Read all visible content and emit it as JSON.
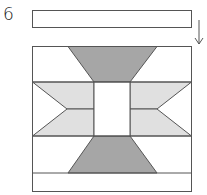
{
  "diagram": {
    "step_number": "6",
    "colors": {
      "outline": "#555555",
      "dark_fabric": "#a6a6a6",
      "light_fabric": "#e0e0e0",
      "background_fabric": "#ffffff"
    },
    "parts": [
      {
        "name": "top-strip",
        "label": "Separate strip to be added"
      },
      {
        "name": "arrow",
        "label": "Down arrow indicating placement"
      },
      {
        "name": "block",
        "label": "Quilt block with hourglass and chevron pattern"
      },
      {
        "name": "bottom-strip",
        "label": "Attached bottom strip"
      }
    ]
  }
}
